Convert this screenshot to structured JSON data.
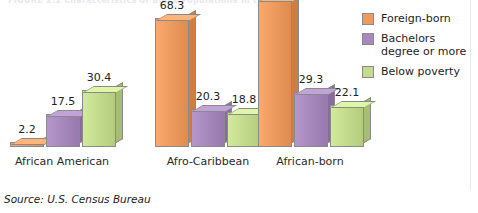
{
  "title_remnant": "FIGURE 2.1   Characteristics of Black Populations in the U.S.",
  "source": "Source: U.S. Census Bureau",
  "legend": {
    "position": "right",
    "items": [
      {
        "label": "Foreign-born",
        "color": "#ED9B5F",
        "swatch_name": "legend-swatch-foreign-born"
      },
      {
        "label": "Bachelors degree or more",
        "color": "#A889BE",
        "swatch_name": "legend-swatch-bachelors-degree"
      },
      {
        "label": "Below poverty",
        "color": "#C3DC8E",
        "swatch_name": "legend-swatch-below-poverty"
      }
    ]
  },
  "colors": {
    "foreign_born": "#ED9B5F",
    "foreign_born_dark": "#D4823F",
    "foreign_born_light": "#F4BC8D",
    "bachelors": "#A889BE",
    "bachelors_dark": "#8E6DA6",
    "bachelors_light": "#C0A9D2",
    "poverty": "#C3DC8E",
    "poverty_dark": "#A8C46C",
    "poverty_light": "#D6E9AE",
    "outline": "#8A8A8A",
    "text": "#222222"
  },
  "chart_data": {
    "type": "bar",
    "title": "",
    "xlabel": "",
    "ylabel": "",
    "ylim": [
      0,
      78.5
    ],
    "grid": false,
    "legend_position": "right",
    "value_labels": true,
    "categories": [
      "African American",
      "Afro-Caribbean",
      "African-born"
    ],
    "series": [
      {
        "name": "Foreign-born",
        "color": "#ED9B5F",
        "values": [
          2.2,
          68.3,
          78.5
        ]
      },
      {
        "name": "Bachelors degree or more",
        "color": "#A889BE",
        "values": [
          17.5,
          20.3,
          29.3
        ]
      },
      {
        "name": "Below poverty",
        "color": "#C3DC8E",
        "values": [
          30.4,
          18.8,
          22.1
        ]
      }
    ]
  },
  "layout": {
    "groups": [
      {
        "left": 10,
        "label_left": 2,
        "label_width": 120
      },
      {
        "left": 155,
        "label_left": 148,
        "label_width": 120
      },
      {
        "left": 258,
        "label_left": 250,
        "label_width": 120
      }
    ],
    "bar_width": 34,
    "bar_gap": 2,
    "px_per_unit": 1.886,
    "min_bar_px": 5
  }
}
